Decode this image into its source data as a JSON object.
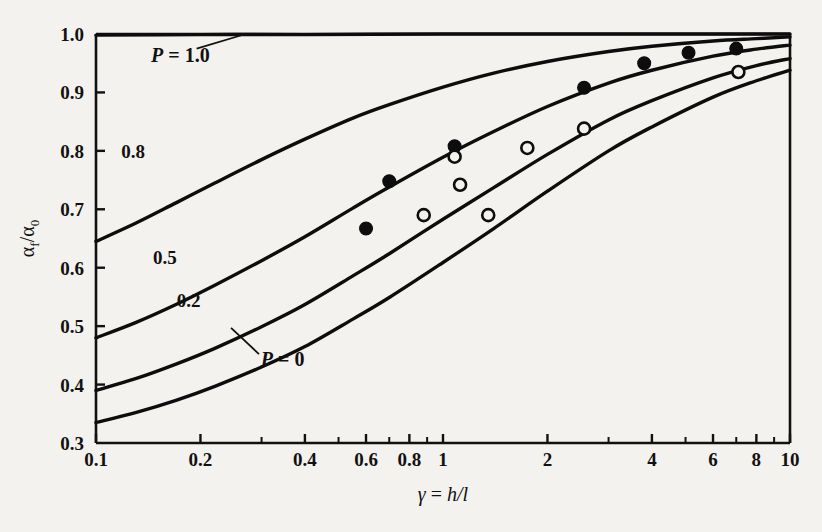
{
  "chart_data": {
    "type": "line",
    "title": "",
    "xlabel": "γ = h/l",
    "ylabel": "αf/α0",
    "xscale": "log",
    "yscale": "linear",
    "xlim": [
      0.1,
      10
    ],
    "ylim": [
      0.3,
      1.0
    ],
    "grid": false,
    "legend_position": "inline-curve-labels",
    "x_ticks_labeled": [
      "0.1",
      "0.2",
      "0.4",
      "0.6",
      "0.8",
      "1",
      "2",
      "4",
      "6",
      "8",
      "10"
    ],
    "x_tick_values": [
      0.1,
      0.2,
      0.4,
      0.6,
      0.8,
      1,
      2,
      4,
      6,
      8,
      10
    ],
    "x_minor_ticks": [
      0.3,
      0.5,
      0.7,
      0.9,
      3,
      5,
      7,
      9
    ],
    "y_ticks_labeled": [
      "0.3",
      "0.4",
      "0.5",
      "0.6",
      "0.7",
      "0.8",
      "0.9",
      "1.0"
    ],
    "y_tick_values": [
      0.3,
      0.4,
      0.5,
      0.6,
      0.7,
      0.8,
      0.9,
      1.0
    ],
    "series": [
      {
        "name": "P = 1.0",
        "label": "P = 1.0",
        "label_prefix_italic": "P",
        "label_rest": " = 1.0",
        "has_leader": true,
        "points": [
          [
            0.1,
            0.998
          ],
          [
            0.2,
            0.999
          ],
          [
            0.4,
            0.999
          ],
          [
            1,
            1.0
          ],
          [
            2,
            1.0
          ],
          [
            4,
            1.0
          ],
          [
            6,
            1.0
          ],
          [
            10,
            1.0
          ]
        ]
      },
      {
        "name": "P = 0.8",
        "label": "0.8",
        "has_leader": false,
        "points": [
          [
            0.1,
            0.645
          ],
          [
            0.13,
            0.676
          ],
          [
            0.17,
            0.711
          ],
          [
            0.22,
            0.745
          ],
          [
            0.3,
            0.785
          ],
          [
            0.4,
            0.82
          ],
          [
            0.55,
            0.856
          ],
          [
            0.7,
            0.879
          ],
          [
            1.0,
            0.909
          ],
          [
            1.4,
            0.933
          ],
          [
            2.0,
            0.953
          ],
          [
            3.0,
            0.97
          ],
          [
            4.0,
            0.979
          ],
          [
            6.0,
            0.988
          ],
          [
            8.0,
            0.992
          ],
          [
            10.0,
            0.995
          ]
        ]
      },
      {
        "name": "P = 0.5",
        "label": "0.5",
        "has_leader": false,
        "points": [
          [
            0.1,
            0.48
          ],
          [
            0.13,
            0.506
          ],
          [
            0.17,
            0.537
          ],
          [
            0.22,
            0.57
          ],
          [
            0.3,
            0.612
          ],
          [
            0.4,
            0.653
          ],
          [
            0.55,
            0.702
          ],
          [
            0.7,
            0.738
          ],
          [
            1.0,
            0.789
          ],
          [
            1.4,
            0.833
          ],
          [
            2.0,
            0.876
          ],
          [
            3.0,
            0.916
          ],
          [
            4.0,
            0.938
          ],
          [
            6.0,
            0.962
          ],
          [
            8.0,
            0.974
          ],
          [
            10.0,
            0.981
          ]
        ]
      },
      {
        "name": "P = 0.2",
        "label": "0.2",
        "has_leader": false,
        "points": [
          [
            0.1,
            0.39
          ],
          [
            0.13,
            0.41
          ],
          [
            0.17,
            0.435
          ],
          [
            0.22,
            0.462
          ],
          [
            0.3,
            0.499
          ],
          [
            0.4,
            0.537
          ],
          [
            0.55,
            0.586
          ],
          [
            0.7,
            0.624
          ],
          [
            1.0,
            0.683
          ],
          [
            1.4,
            0.737
          ],
          [
            2.0,
            0.794
          ],
          [
            3.0,
            0.853
          ],
          [
            4.0,
            0.886
          ],
          [
            6.0,
            0.925
          ],
          [
            8.0,
            0.946
          ],
          [
            10.0,
            0.958
          ]
        ]
      },
      {
        "name": "P = 0",
        "label": "P = 0",
        "label_prefix_italic": "P",
        "label_rest": " = 0",
        "has_leader": true,
        "points": [
          [
            0.1,
            0.335
          ],
          [
            0.13,
            0.352
          ],
          [
            0.17,
            0.373
          ],
          [
            0.22,
            0.397
          ],
          [
            0.3,
            0.43
          ],
          [
            0.4,
            0.465
          ],
          [
            0.55,
            0.512
          ],
          [
            0.7,
            0.549
          ],
          [
            1.0,
            0.609
          ],
          [
            1.4,
            0.667
          ],
          [
            2.0,
            0.731
          ],
          [
            3.0,
            0.8
          ],
          [
            4.0,
            0.841
          ],
          [
            6.0,
            0.892
          ],
          [
            8.0,
            0.92
          ],
          [
            10.0,
            0.938
          ]
        ]
      }
    ],
    "scatter": [
      {
        "name": "filled-circles",
        "marker": "filled-circle",
        "points": [
          [
            0.6,
            0.667
          ],
          [
            0.7,
            0.748
          ],
          [
            1.08,
            0.808
          ],
          [
            2.55,
            0.908
          ],
          [
            3.8,
            0.95
          ],
          [
            5.1,
            0.968
          ],
          [
            7.0,
            0.975
          ]
        ]
      },
      {
        "name": "open-circles",
        "marker": "open-circle",
        "points": [
          [
            0.88,
            0.69
          ],
          [
            1.08,
            0.79
          ],
          [
            1.12,
            0.742
          ],
          [
            1.35,
            0.69
          ],
          [
            1.75,
            0.805
          ],
          [
            2.55,
            0.838
          ],
          [
            7.1,
            0.935
          ]
        ]
      }
    ],
    "curve_label_positions": {
      "P_1_0": {
        "x": 0.175,
        "y": 0.952
      },
      "P_0_8": {
        "x": 0.128,
        "y": 0.787
      },
      "P_0_5": {
        "x": 0.158,
        "y": 0.607
      },
      "P_0_2": {
        "x": 0.185,
        "y": 0.533
      },
      "P_0": {
        "x": 0.345,
        "y": 0.432
      }
    }
  },
  "axis": {
    "ylabel_main": "α",
    "ylabel_sub1": "f",
    "ylabel_slash": "/α",
    "ylabel_sub2": "0",
    "xlabel_gamma": "γ",
    "xlabel_eq": " = ",
    "xlabel_h": "h",
    "xlabel_sl": "/",
    "xlabel_l": "l"
  },
  "colors": {
    "background": "#f4f2ee",
    "ink": "#111111",
    "curve": "#0d0d0d"
  }
}
